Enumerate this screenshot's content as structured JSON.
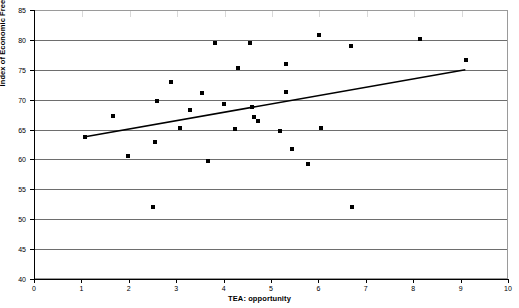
{
  "chart_data": {
    "type": "scatter",
    "title": "",
    "xlabel": "TEA: opportunity",
    "ylabel": "Index of Economic Freedom",
    "xlim": [
      0,
      10
    ],
    "ylim": [
      40,
      85
    ],
    "xticks": [
      0,
      1,
      2,
      3,
      4,
      5,
      6,
      7,
      8,
      9,
      10
    ],
    "yticks": [
      40,
      45,
      50,
      55,
      60,
      65,
      70,
      75,
      80,
      85
    ],
    "grid": "horizontal",
    "legend": "none",
    "marker": "square",
    "marker_color": "#000000",
    "points": [
      {
        "x": 1.08,
        "y": 63.7
      },
      {
        "x": 1.67,
        "y": 67.2
      },
      {
        "x": 1.98,
        "y": 60.6
      },
      {
        "x": 2.52,
        "y": 52.1
      },
      {
        "x": 2.55,
        "y": 62.9
      },
      {
        "x": 2.6,
        "y": 69.8
      },
      {
        "x": 2.9,
        "y": 72.9
      },
      {
        "x": 3.08,
        "y": 65.2
      },
      {
        "x": 3.3,
        "y": 68.2
      },
      {
        "x": 3.55,
        "y": 71.1
      },
      {
        "x": 3.68,
        "y": 59.8
      },
      {
        "x": 3.82,
        "y": 79.4
      },
      {
        "x": 4.0,
        "y": 69.2
      },
      {
        "x": 4.3,
        "y": 75.3
      },
      {
        "x": 4.25,
        "y": 65.1
      },
      {
        "x": 4.55,
        "y": 79.4
      },
      {
        "x": 4.6,
        "y": 68.7
      },
      {
        "x": 4.65,
        "y": 67.1
      },
      {
        "x": 4.72,
        "y": 66.4
      },
      {
        "x": 5.32,
        "y": 71.2
      },
      {
        "x": 5.2,
        "y": 64.7
      },
      {
        "x": 5.45,
        "y": 61.8
      },
      {
        "x": 5.32,
        "y": 75.9
      },
      {
        "x": 5.78,
        "y": 59.3
      },
      {
        "x": 6.02,
        "y": 80.9
      },
      {
        "x": 6.05,
        "y": 65.3
      },
      {
        "x": 6.7,
        "y": 52.1
      },
      {
        "x": 6.68,
        "y": 79.0
      },
      {
        "x": 8.15,
        "y": 80.1
      },
      {
        "x": 9.12,
        "y": 76.7
      }
    ],
    "trend_line": {
      "x_start": 1.08,
      "y_start": 63.8,
      "x_end": 9.1,
      "y_end": 75.0,
      "color": "#000000"
    }
  }
}
